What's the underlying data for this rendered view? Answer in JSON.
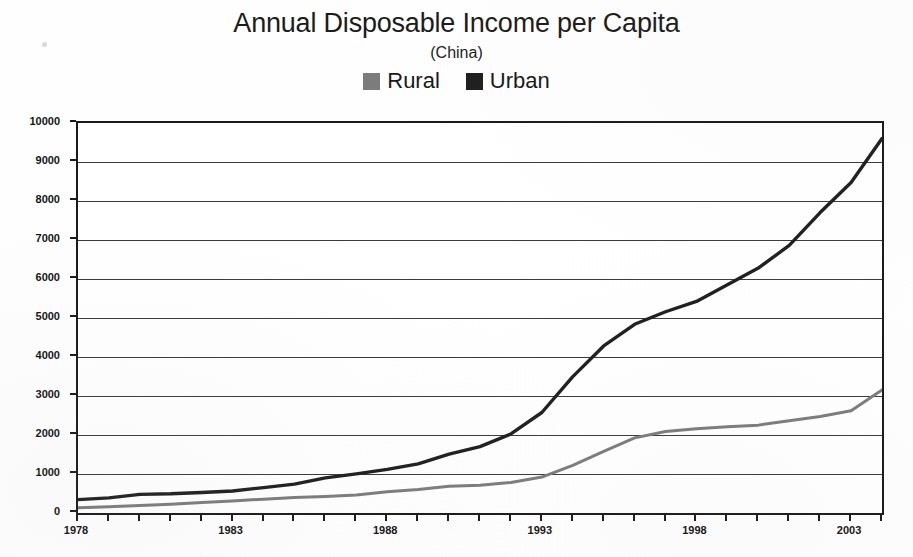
{
  "chart_data": {
    "type": "line",
    "title": "Annual Disposable Income per Capita",
    "subtitle": "(China)",
    "xlabel": "",
    "ylabel": "",
    "xlim": [
      1978,
      2004
    ],
    "ylim": [
      0,
      10000
    ],
    "grid": true,
    "legend_position": "top-center",
    "y_ticks": [
      0,
      1000,
      2000,
      3000,
      4000,
      5000,
      6000,
      7000,
      8000,
      9000,
      10000
    ],
    "y_tick_labels": [
      "0",
      "1000",
      "2000",
      "3000",
      "4000",
      "5000",
      "6000",
      "7000",
      "8000",
      "9000",
      "10000"
    ],
    "x_ticks": [
      1978,
      1979,
      1980,
      1981,
      1982,
      1983,
      1984,
      1985,
      1986,
      1987,
      1988,
      1989,
      1990,
      1991,
      1992,
      1993,
      1994,
      1995,
      1996,
      1997,
      1998,
      1999,
      2000,
      2001,
      2002,
      2003,
      2004
    ],
    "x_tick_labels_shown": [
      "1978",
      "1983",
      "1988",
      "1993",
      "1998",
      "2003"
    ],
    "x": [
      1978,
      1979,
      1980,
      1981,
      1982,
      1983,
      1984,
      1985,
      1986,
      1987,
      1988,
      1989,
      1990,
      1991,
      1992,
      1993,
      1994,
      1995,
      1996,
      1997,
      1998,
      1999,
      2000,
      2001,
      2002,
      2003,
      2004
    ],
    "series": [
      {
        "name": "Rural",
        "color": "#7c7c7c",
        "values": [
          134,
          160,
          191,
          223,
          270,
          310,
          355,
          398,
          424,
          463,
          545,
          602,
          686,
          709,
          784,
          922,
          1221,
          1578,
          1926,
          2090,
          2162,
          2210,
          2253,
          2366,
          2476,
          2622,
          3155
        ]
      },
      {
        "name": "Urban",
        "color": "#1f1f1f",
        "values": [
          343,
          387,
          478,
          492,
          527,
          565,
          652,
          739,
          900,
          1002,
          1119,
          1261,
          1510,
          1701,
          2027,
          2577,
          3496,
          4283,
          4839,
          5160,
          5425,
          5854,
          6280,
          6860,
          7703,
          8472,
          9600
        ]
      }
    ]
  }
}
